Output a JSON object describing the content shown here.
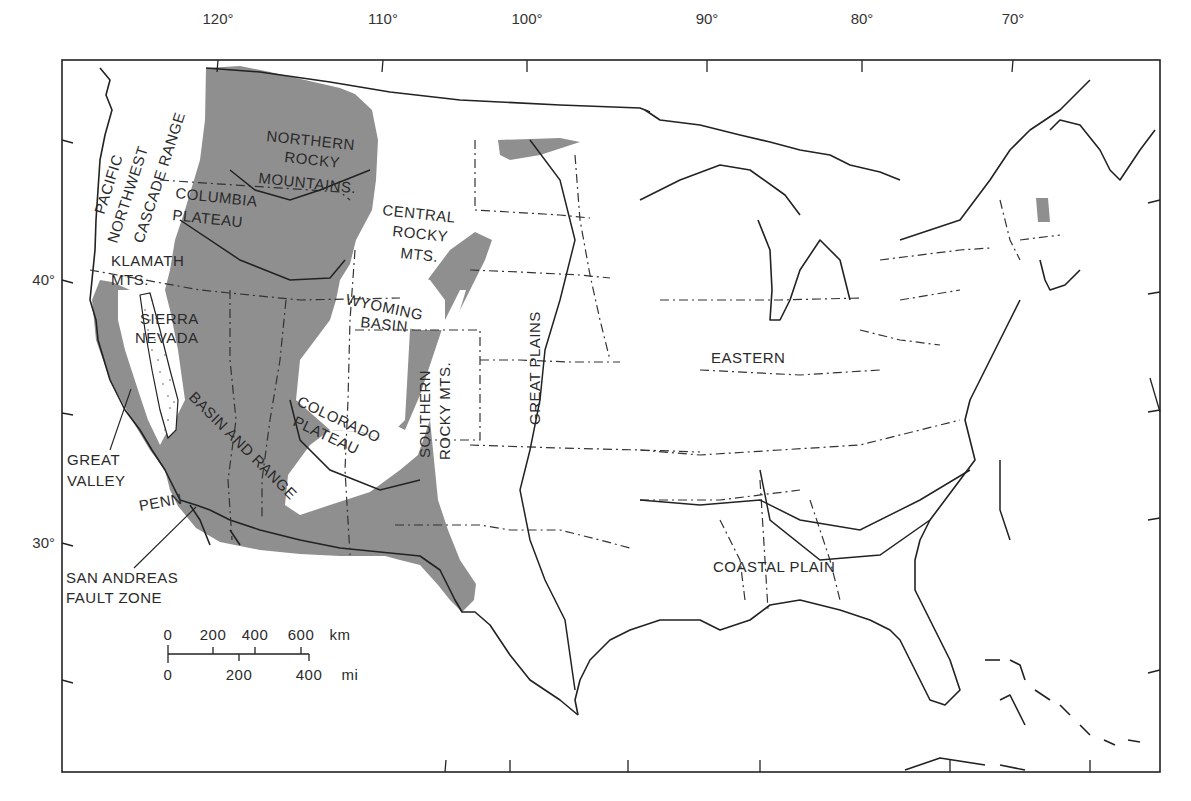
{
  "map": {
    "title": "Physiographic provinces of the conterminous United States",
    "longitude_ticks": [
      {
        "label": "120°",
        "x": 218
      },
      {
        "label": "110°",
        "x": 383
      },
      {
        "label": "100°",
        "x": 527
      },
      {
        "label": "90°",
        "x": 707
      },
      {
        "label": "80°",
        "x": 862
      },
      {
        "label": "70°",
        "x": 1013
      }
    ],
    "latitude_ticks": [
      {
        "label": "40°",
        "y": 280
      },
      {
        "label": "30°",
        "y": 543
      }
    ],
    "regions": {
      "pacific_northwest": "PACIFIC NORTHWEST",
      "pacific": "PACIFIC",
      "northwest": "NORTHWEST",
      "cascade_range": "CASCADE RANGE",
      "columbia": "COLUMBIA",
      "plateau_1": "PLATEAU",
      "northern": "NORTHERN",
      "rocky_1": "ROCKY",
      "mountains": "MOUNTAINS.",
      "central": "CENTRAL",
      "rocky_2": "ROCKY",
      "mts_1": "MTS.",
      "klamath": "KLAMATH",
      "mts_2": "MTS.",
      "sierra": "SIERRA",
      "nevada": "NEVADA",
      "wyoming": "WYOMING",
      "basin": "BASIN",
      "great_plains": "GREAT PLAINS",
      "eastern": "EASTERN",
      "colorado": "COLORADO",
      "plateau_2": "PLATEAU",
      "southern": "SOUTHERN",
      "rocky_mts": "ROCKY MTS.",
      "basin_and_range": "BASIN AND RANGE",
      "great": "GREAT",
      "valley": "VALLEY",
      "penn": "PENN",
      "san_andreas": "SAN ANDREAS",
      "fault_zone": "FAULT ZONE",
      "coastal_plain": "COASTAL PLAIN"
    },
    "scale_bar": {
      "km_labels": [
        "0",
        "200",
        "400",
        "600",
        "km"
      ],
      "mi_labels": [
        "0",
        "200",
        "400",
        "mi"
      ]
    },
    "colors": {
      "shaded_region": "#8f8f8f",
      "line": "#222222",
      "background": "#ffffff"
    }
  }
}
